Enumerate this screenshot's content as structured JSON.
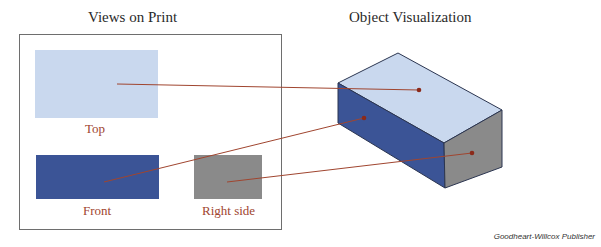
{
  "titles": {
    "left": "Views on Print",
    "right": "Object Visualization"
  },
  "views": {
    "top": {
      "label": "Top",
      "color": "#c9d8ee"
    },
    "front": {
      "label": "Front",
      "color": "#3b5496"
    },
    "right_side": {
      "label": "Right side",
      "color": "#8a8a8a"
    }
  },
  "leader_color": "#a0452f",
  "credit": "Goodheart-Willcox Publisher"
}
